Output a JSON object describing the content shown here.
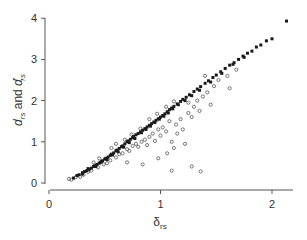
{
  "chart_data": {
    "type": "scatter",
    "title": "",
    "xlabel": "δ_rs",
    "ylabel": "d_rs and d'_rs",
    "xlim": [
      0,
      2.2
    ],
    "ylim": [
      0,
      4
    ],
    "xticks": [
      0,
      1,
      2
    ],
    "yticks": [
      0,
      1,
      2,
      3,
      4
    ],
    "grid": false,
    "legend": null,
    "series": [
      {
        "name": "d_rs (filled)",
        "marker": "filled-square",
        "color": "#1a1a1a",
        "points": [
          [
            0.22,
            0.12
          ],
          [
            0.25,
            0.18
          ],
          [
            0.27,
            0.2
          ],
          [
            0.3,
            0.25
          ],
          [
            0.32,
            0.28
          ],
          [
            0.34,
            0.3
          ],
          [
            0.36,
            0.33
          ],
          [
            0.38,
            0.36
          ],
          [
            0.4,
            0.4
          ],
          [
            0.41,
            0.42
          ],
          [
            0.43,
            0.45
          ],
          [
            0.45,
            0.48
          ],
          [
            0.46,
            0.5
          ],
          [
            0.48,
            0.54
          ],
          [
            0.5,
            0.58
          ],
          [
            0.51,
            0.6
          ],
          [
            0.53,
            0.63
          ],
          [
            0.55,
            0.67
          ],
          [
            0.56,
            0.7
          ],
          [
            0.58,
            0.73
          ],
          [
            0.6,
            0.78
          ],
          [
            0.61,
            0.8
          ],
          [
            0.63,
            0.84
          ],
          [
            0.65,
            0.88
          ],
          [
            0.66,
            0.9
          ],
          [
            0.68,
            0.95
          ],
          [
            0.7,
            1.0
          ],
          [
            0.71,
            1.02
          ],
          [
            0.73,
            1.06
          ],
          [
            0.75,
            1.1
          ],
          [
            0.76,
            1.13
          ],
          [
            0.78,
            1.17
          ],
          [
            0.8,
            1.2
          ],
          [
            0.82,
            1.24
          ],
          [
            0.84,
            1.28
          ],
          [
            0.86,
            1.32
          ],
          [
            0.88,
            1.36
          ],
          [
            0.9,
            1.4
          ],
          [
            0.92,
            1.44
          ],
          [
            0.94,
            1.48
          ],
          [
            0.96,
            1.52
          ],
          [
            0.98,
            1.56
          ],
          [
            1.0,
            1.6
          ],
          [
            1.02,
            1.64
          ],
          [
            1.04,
            1.68
          ],
          [
            1.06,
            1.73
          ],
          [
            1.08,
            1.78
          ],
          [
            1.1,
            1.82
          ],
          [
            1.12,
            1.86
          ],
          [
            1.15,
            1.92
          ],
          [
            1.18,
            1.98
          ],
          [
            1.2,
            2.03
          ],
          [
            1.23,
            2.08
          ],
          [
            1.26,
            2.14
          ],
          [
            1.3,
            2.22
          ],
          [
            1.33,
            2.28
          ],
          [
            1.36,
            2.34
          ],
          [
            1.4,
            2.42
          ],
          [
            1.43,
            2.48
          ],
          [
            1.47,
            2.56
          ],
          [
            1.5,
            2.62
          ],
          [
            1.54,
            2.7
          ],
          [
            1.58,
            2.78
          ],
          [
            1.62,
            2.86
          ],
          [
            1.66,
            2.92
          ],
          [
            1.7,
            3.0
          ],
          [
            1.74,
            3.08
          ],
          [
            1.78,
            3.15
          ],
          [
            1.82,
            3.2
          ],
          [
            1.86,
            3.3
          ],
          [
            1.9,
            3.35
          ],
          [
            1.95,
            3.45
          ],
          [
            2.0,
            3.5
          ],
          [
            2.13,
            3.93
          ],
          [
            0.3,
            0.22
          ],
          [
            0.35,
            0.35
          ],
          [
            0.42,
            0.4
          ],
          [
            0.47,
            0.52
          ],
          [
            0.52,
            0.57
          ],
          [
            0.57,
            0.68
          ],
          [
            0.62,
            0.76
          ],
          [
            0.67,
            0.87
          ],
          [
            0.72,
            0.98
          ],
          [
            0.77,
            1.08
          ],
          [
            0.83,
            1.22
          ],
          [
            0.87,
            1.3
          ],
          [
            0.91,
            1.38
          ],
          [
            0.95,
            1.47
          ],
          [
            0.99,
            1.55
          ],
          [
            1.03,
            1.62
          ],
          [
            1.07,
            1.7
          ],
          [
            1.11,
            1.8
          ],
          [
            1.16,
            1.9
          ],
          [
            1.22,
            2.0
          ],
          [
            1.28,
            2.12
          ],
          [
            1.35,
            2.25
          ],
          [
            1.45,
            2.45
          ],
          [
            1.55,
            2.66
          ],
          [
            1.65,
            2.88
          ],
          [
            1.75,
            3.05
          ]
        ]
      },
      {
        "name": "d'_rs (open)",
        "marker": "open-circle",
        "color": "#555555",
        "points": [
          [
            0.18,
            0.1
          ],
          [
            0.2,
            0.08
          ],
          [
            0.24,
            0.14
          ],
          [
            0.28,
            0.15
          ],
          [
            0.31,
            0.2
          ],
          [
            0.35,
            0.27
          ],
          [
            0.38,
            0.3
          ],
          [
            0.44,
            0.38
          ],
          [
            0.49,
            0.45
          ],
          [
            0.52,
            0.48
          ],
          [
            0.55,
            0.55
          ],
          [
            0.6,
            0.62
          ],
          [
            0.63,
            0.7
          ],
          [
            0.66,
            0.72
          ],
          [
            0.7,
            0.82
          ],
          [
            0.72,
            0.78
          ],
          [
            0.75,
            0.9
          ],
          [
            0.78,
            0.95
          ],
          [
            0.8,
            0.88
          ],
          [
            0.83,
            1.0
          ],
          [
            0.86,
            1.05
          ],
          [
            0.88,
            0.92
          ],
          [
            0.9,
            1.12
          ],
          [
            0.93,
            1.2
          ],
          [
            0.95,
            1.02
          ],
          [
            0.98,
            1.3
          ],
          [
            1.0,
            1.15
          ],
          [
            1.02,
            1.35
          ],
          [
            1.05,
            1.25
          ],
          [
            1.08,
            1.5
          ],
          [
            1.1,
            1.0
          ],
          [
            1.12,
            0.85
          ],
          [
            1.14,
            1.42
          ],
          [
            1.18,
            1.55
          ],
          [
            1.2,
            1.3
          ],
          [
            1.22,
            0.95
          ],
          [
            1.25,
            1.7
          ],
          [
            1.3,
            1.85
          ],
          [
            1.33,
            2.0
          ],
          [
            1.38,
            2.1
          ],
          [
            1.42,
            2.2
          ],
          [
            1.48,
            2.35
          ],
          [
            1.52,
            2.5
          ],
          [
            1.6,
            2.6
          ],
          [
            1.68,
            2.75
          ],
          [
            0.68,
            1.05
          ],
          [
            0.74,
            1.18
          ],
          [
            0.82,
            1.32
          ],
          [
            0.9,
            1.55
          ],
          [
            0.97,
            1.68
          ],
          [
            1.05,
            1.85
          ],
          [
            1.12,
            1.98
          ],
          [
            1.25,
            1.95
          ],
          [
            1.4,
            2.6
          ],
          [
            0.6,
            0.95
          ],
          [
            0.56,
            0.85
          ],
          [
            0.45,
            0.6
          ],
          [
            0.4,
            0.5
          ],
          [
            1.15,
            1.2
          ],
          [
            1.28,
            1.6
          ],
          [
            1.35,
            1.75
          ],
          [
            1.06,
            0.72
          ],
          [
            0.98,
            0.6
          ],
          [
            1.28,
            0.4
          ],
          [
            1.1,
            0.3
          ],
          [
            1.36,
            0.28
          ],
          [
            0.84,
            0.45
          ],
          [
            0.7,
            0.5
          ],
          [
            1.45,
            1.9
          ],
          [
            1.62,
            2.3
          ]
        ]
      }
    ],
    "trend": "approximately linear, d ≈ 1.85·δ − 0.2, tightly clustered up to δ≈2.13, d≈3.93"
  },
  "axes": {
    "x_ticks": [
      "0",
      "1",
      "2"
    ],
    "y_ticks": [
      "0",
      "1",
      "2",
      "3",
      "4"
    ],
    "xlabel_main": "δ",
    "xlabel_sub": "rs",
    "ylabel_d1": "d",
    "ylabel_sub1": "rs",
    "ylabel_and": " and ",
    "ylabel_d2": "d",
    "ylabel_prime": "′",
    "ylabel_sub2": "rs"
  }
}
